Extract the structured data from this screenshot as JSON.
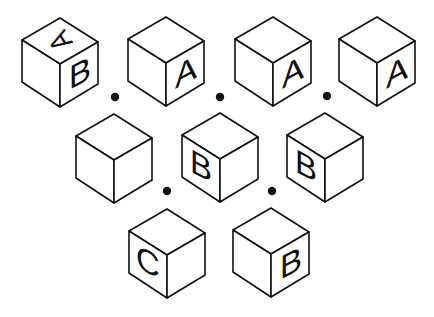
{
  "puzzle": {
    "description": "Nine cubes arranged in an inverted triangle (4, 3, 2) with dots between adjacent cubes",
    "colors": {
      "background": "#ffffff",
      "stroke": "#111111",
      "face": "#ffffff"
    },
    "cubes": [
      {
        "id": "cube-1",
        "row": 1,
        "col": 1,
        "cx": 60,
        "top": 18,
        "faces": {
          "top": "A",
          "left": "",
          "right": "B"
        },
        "top_rotation": -150
      },
      {
        "id": "cube-2",
        "row": 1,
        "col": 2,
        "cx": 166,
        "top": 17,
        "faces": {
          "top": "",
          "left": "",
          "right": "A"
        }
      },
      {
        "id": "cube-3",
        "row": 1,
        "col": 3,
        "cx": 273,
        "top": 17,
        "faces": {
          "top": "",
          "left": "",
          "right": "A"
        }
      },
      {
        "id": "cube-4",
        "row": 1,
        "col": 4,
        "cx": 377,
        "top": 17,
        "faces": {
          "top": "",
          "left": "",
          "right": "A"
        }
      },
      {
        "id": "cube-5",
        "row": 2,
        "col": 1,
        "cx": 114,
        "top": 114,
        "faces": {
          "top": "",
          "left": "",
          "right": ""
        }
      },
      {
        "id": "cube-6",
        "row": 2,
        "col": 2,
        "cx": 220,
        "top": 113,
        "faces": {
          "top": "",
          "left": "B",
          "right": ""
        }
      },
      {
        "id": "cube-7",
        "row": 2,
        "col": 3,
        "cx": 325,
        "top": 113,
        "faces": {
          "top": "",
          "left": "B",
          "right": ""
        }
      },
      {
        "id": "cube-8",
        "row": 3,
        "col": 1,
        "cx": 167,
        "top": 209,
        "faces": {
          "top": "",
          "left": "C",
          "right": ""
        }
      },
      {
        "id": "cube-9",
        "row": 3,
        "col": 2,
        "cx": 271,
        "top": 208,
        "faces": {
          "top": "",
          "left": "",
          "right": "B"
        }
      }
    ],
    "dots": [
      {
        "x": 115,
        "y": 97
      },
      {
        "x": 220,
        "y": 97
      },
      {
        "x": 327,
        "y": 96
      },
      {
        "x": 167,
        "y": 191
      },
      {
        "x": 272,
        "y": 191
      }
    ]
  }
}
